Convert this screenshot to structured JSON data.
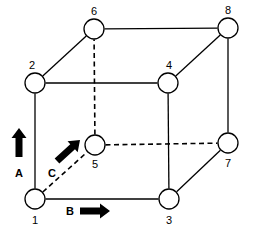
{
  "figure": {
    "background_color": "#ffffff",
    "stroke_color": "#000000",
    "node_fill_color": "#ffffff",
    "arrow_color": "#000000",
    "width": 253,
    "height": 237
  },
  "nodes": [
    {
      "id": "1",
      "label": "1",
      "cx": 35,
      "cy": 199,
      "r": 10,
      "label_x": 32,
      "label_y": 215
    },
    {
      "id": "2",
      "label": "2",
      "cx": 35,
      "cy": 83,
      "r": 10,
      "label_x": 29,
      "label_y": 60
    },
    {
      "id": "3",
      "label": "3",
      "cx": 169,
      "cy": 199,
      "r": 10,
      "label_x": 166,
      "label_y": 215
    },
    {
      "id": "4",
      "label": "4",
      "cx": 168,
      "cy": 83,
      "r": 10,
      "label_x": 166,
      "label_y": 60
    },
    {
      "id": "5",
      "label": "5",
      "cx": 95,
      "cy": 145,
      "r": 10,
      "label_x": 92,
      "label_y": 159
    },
    {
      "id": "6",
      "label": "6",
      "cx": 94,
      "cy": 29,
      "r": 10,
      "label_x": 91,
      "label_y": 6
    },
    {
      "id": "7",
      "label": "7",
      "cx": 228,
      "cy": 143,
      "r": 10,
      "label_x": 225,
      "label_y": 158
    },
    {
      "id": "8",
      "label": "8",
      "cx": 228,
      "cy": 28,
      "r": 10,
      "label_x": 225,
      "label_y": 5
    }
  ],
  "edges": [
    {
      "from": "1",
      "to": "2",
      "style": "solid"
    },
    {
      "from": "1",
      "to": "3",
      "style": "solid"
    },
    {
      "from": "1",
      "to": "5",
      "style": "dashed"
    },
    {
      "from": "2",
      "to": "4",
      "style": "solid"
    },
    {
      "from": "2",
      "to": "6",
      "style": "solid"
    },
    {
      "from": "3",
      "to": "4",
      "style": "solid"
    },
    {
      "from": "3",
      "to": "7",
      "style": "solid"
    },
    {
      "from": "4",
      "to": "8",
      "style": "solid"
    },
    {
      "from": "5",
      "to": "6",
      "style": "dashed"
    },
    {
      "from": "5",
      "to": "7",
      "style": "dashed"
    },
    {
      "from": "6",
      "to": "8",
      "style": "solid"
    },
    {
      "from": "7",
      "to": "8",
      "style": "solid"
    }
  ],
  "arrows": [
    {
      "id": "A",
      "label": "A",
      "direction": "up",
      "angle_deg": -90,
      "tail_x": 19,
      "tail_y": 157,
      "head_x": 19,
      "head_y": 128,
      "label_x": 15,
      "label_y": 168
    },
    {
      "id": "B",
      "label": "B",
      "direction": "right",
      "angle_deg": 0,
      "tail_x": 80,
      "tail_y": 211,
      "head_x": 110,
      "head_y": 211,
      "label_x": 66,
      "label_y": 206
    },
    {
      "id": "C",
      "label": "C",
      "direction": "up-right",
      "angle_deg": -42,
      "tail_x": 57,
      "tail_y": 161,
      "head_x": 80,
      "head_y": 140,
      "label_x": 48,
      "label_y": 168
    }
  ]
}
